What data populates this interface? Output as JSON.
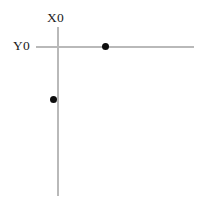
{
  "figure": {
    "width": 206,
    "height": 205,
    "background_color": "#ffffff",
    "axis_color": "#b9b9b9",
    "point_color": "#0d0d0d",
    "label_color": "#1a1a1a"
  },
  "axes": {
    "vertical": {
      "label": "X0",
      "name": "x-axis",
      "x": 58,
      "y_start": 27,
      "y_end": 196
    },
    "horizontal": {
      "label": "Y0",
      "name": "y-axis",
      "y": 47,
      "x_start": 36,
      "x_end": 194
    },
    "origin": {
      "x": 58,
      "y": 47
    }
  },
  "points": [
    {
      "name": "point-on-horizontal-axis",
      "x": 105,
      "y": 47,
      "diameter": 7
    },
    {
      "name": "point-on-vertical-axis",
      "x": 53,
      "y": 100,
      "diameter": 7
    }
  ],
  "chart_data": {
    "type": "scatter",
    "title": "",
    "subtitle": "",
    "xlabel": "X0",
    "ylabel": "Y0",
    "grid": false,
    "legend": null,
    "axis_style": "crossed-axes",
    "origin": [
      58,
      47
    ],
    "xlim": [
      36,
      194
    ],
    "ylim": [
      27,
      196
    ],
    "series": [
      {
        "name": "points",
        "x": [
          105,
          53
        ],
        "y": [
          47,
          100
        ],
        "marker": "filled-circle",
        "marker_color": "#0d0d0d",
        "marker_size": 7
      }
    ],
    "annotations": [
      {
        "text": "X0",
        "x": 58,
        "y": 18,
        "anchor": "above-vertical-axis"
      },
      {
        "text": "Y0",
        "x": 25,
        "y": 46,
        "anchor": "left-of-horizontal-axis"
      }
    ]
  }
}
